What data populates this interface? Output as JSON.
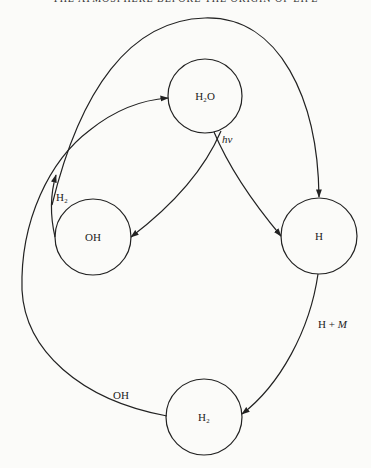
{
  "header": {
    "title": "THE ATMOSPHERE BEFORE THE ORIGIN OF LIFE"
  },
  "diagram": {
    "nodes": [
      {
        "id": "h2o",
        "label": "H₂O",
        "cx": 205,
        "cy": 96,
        "r": 37
      },
      {
        "id": "oh",
        "label": "OH",
        "cx": 93,
        "cy": 237,
        "r": 38
      },
      {
        "id": "h",
        "label": "H",
        "cx": 319,
        "cy": 236,
        "r": 38
      },
      {
        "id": "h2",
        "label": "H₂",
        "cx": 204,
        "cy": 417,
        "r": 38
      }
    ],
    "edges": [
      {
        "from": "h2o",
        "to": "oh",
        "label": ""
      },
      {
        "from": "h2o",
        "to": "h",
        "label": "hν"
      },
      {
        "from": "oh",
        "to": "h",
        "label": ""
      },
      {
        "from": "h",
        "to": "h2",
        "label": "H + M"
      },
      {
        "from": "h2",
        "to": "h2o",
        "label": "OH"
      },
      {
        "from": "oh",
        "to": "h2o",
        "label": "H₂"
      }
    ],
    "labels": {
      "hv": "hν",
      "h_plus_m_prefix": "H + ",
      "h_plus_m_italic": "M",
      "oh_edge": "OH",
      "h2_edge": "H₂"
    },
    "stroke_color": "#222222"
  }
}
